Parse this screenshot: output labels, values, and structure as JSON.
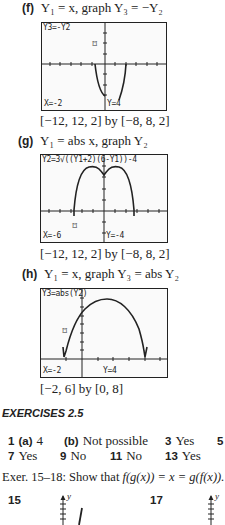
{
  "part_f": {
    "label": "(f)",
    "text": "Y₁ = x, graph Y₃ = −Y₂",
    "screen": {
      "top_text": "Y3=-Y2",
      "x_readout": "X=-2",
      "y_readout": "Y=4",
      "cursor": "⌑"
    },
    "window": "[−12, 12, 2] by [−8, 8, 2]"
  },
  "part_g": {
    "label": "(g)",
    "text": "Y₁ = abs x, graph Y₂",
    "screen": {
      "top_text": "Y2=3√((Y1+2)(6-Y1))-4",
      "x_readout": "X=-6",
      "y_readout": "Y=-4",
      "cursor": "⌑"
    },
    "window": "[−12, 12, 2] by [−8, 8, 2]"
  },
  "part_h": {
    "label": "(h)",
    "text": "Y₁ = x, graph Y₃ = abs Y₂",
    "screen": {
      "top_text": "Y3=abs(Y2)",
      "x_readout": "X=-2",
      "y_readout": "Y=4",
      "cursor": "⌑"
    },
    "window": "[−2, 6] by [0, 8]"
  },
  "exercises": {
    "title": "EXERCISES 2.5",
    "row1": [
      {
        "num": "1",
        "sub": "(a)",
        "answer": "4"
      },
      {
        "sub": "(b)",
        "answer": "Not possible"
      },
      {
        "num": "3",
        "answer": "Yes"
      },
      {
        "num": "5",
        "answer": ""
      }
    ],
    "row2": [
      {
        "num": "7",
        "answer": "Yes"
      },
      {
        "num": "9",
        "answer": "No"
      },
      {
        "num": "11",
        "answer": "No"
      },
      {
        "num": "13",
        "answer": "Yes"
      }
    ],
    "instruction_prefix": "Exer. 15–18: Show that ",
    "instruction_formula": "f(g(x)) = x = g(f(x)).",
    "figures": [
      {
        "num": "15",
        "axis_label": "y"
      },
      {
        "num": "17",
        "axis_label": "y"
      }
    ]
  }
}
